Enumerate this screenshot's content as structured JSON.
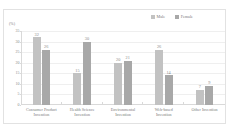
{
  "chart_data": {
    "type": "bar",
    "title": "",
    "subtitle": "",
    "xlabel": "",
    "ylabel": "(%)",
    "ylim": [
      0,
      35
    ],
    "yticks": [
      0,
      5,
      10,
      15,
      20,
      25,
      30,
      35
    ],
    "ytick_labels": [
      "0",
      "5",
      "10",
      "15",
      "20",
      "25",
      "30",
      "35"
    ],
    "grid": true,
    "legend_position": "top-center",
    "categories": [
      "Consumer Product Invention",
      "Health Science Invention",
      "Environmental Invention",
      "Web-based Invention",
      "Other Invention"
    ],
    "category_lines": [
      [
        "Consumer Product",
        "Invention"
      ],
      [
        "Health Science",
        "Invention"
      ],
      [
        "Environmental",
        "Invention"
      ],
      [
        "Web-based",
        "Invention"
      ],
      [
        "Other Invention",
        ""
      ]
    ],
    "series": [
      {
        "name": "Male",
        "color": "#c2c2c2",
        "values": [
          32,
          15,
          20,
          26,
          7
        ],
        "labels": [
          "32",
          "15",
          "20",
          "26",
          "7"
        ]
      },
      {
        "name": "Female",
        "color": "#a8a8a8",
        "values": [
          26,
          30,
          21,
          14,
          9
        ],
        "labels": [
          "26",
          "30",
          "21",
          "14",
          "9"
        ]
      }
    ]
  },
  "legend": {
    "items": [
      {
        "label": "Male",
        "color": "#c2c2c2"
      },
      {
        "label": "Female",
        "color": "#a8a8a8"
      }
    ]
  },
  "axis": {
    "y_unit": "(%)"
  },
  "colors": {
    "male": "#c2c2c2",
    "female": "#a8a8a8",
    "gridline": "#efefef",
    "axis": "#d9d9d9",
    "text": "#7a7a7a",
    "border": "#e2e2e2",
    "background": "#ffffff"
  }
}
